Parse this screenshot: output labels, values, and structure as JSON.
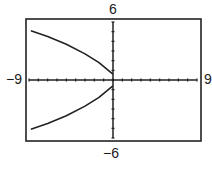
{
  "chart_data": {
    "type": "line",
    "title": "",
    "xlabel": "",
    "ylabel": "",
    "xlim": [
      -9,
      9
    ],
    "ylim": [
      -6,
      6
    ],
    "x_tick_step": 1,
    "y_tick_step": 1,
    "grid": false,
    "axis_labels": {
      "ymax": "6",
      "ymin": "−6",
      "xmin": "−9",
      "xmax": "9"
    },
    "series": [
      {
        "name": "upper branch",
        "x": [
          -8.8,
          -7,
          -5,
          -3,
          -1.5,
          -0.5,
          0
        ],
        "y": [
          5.1,
          4.5,
          3.7,
          2.7,
          1.8,
          1.0,
          0.6
        ]
      },
      {
        "name": "lower branch",
        "x": [
          -8.8,
          -7,
          -5,
          -3,
          -1.5,
          -0.5,
          0
        ],
        "y": [
          -5.1,
          -4.5,
          -3.7,
          -2.7,
          -1.8,
          -1.0,
          -0.6
        ]
      }
    ],
    "colors": {
      "curve": "#222222",
      "axes": "#222222",
      "frame": "#222222"
    }
  }
}
